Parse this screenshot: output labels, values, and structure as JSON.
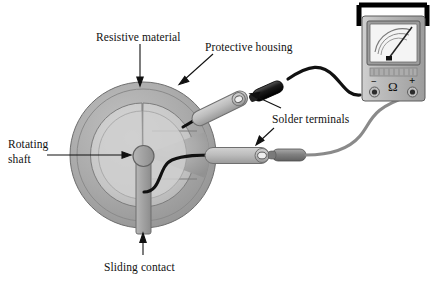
{
  "figure": {
    "type": "technical-illustration"
  },
  "labels": {
    "resistive_material": "Resistive material",
    "protective_housing": "Protective housing",
    "solder_terminals": "Solder terminals",
    "rotating_shaft_line1": "Rotating",
    "rotating_shaft_line2": "shaft",
    "sliding_contact": "Sliding contact"
  },
  "meter": {
    "name": "analog-ohmmeter",
    "unit_symbol": "Ω",
    "negative_terminal": "−",
    "positive_terminal": "+",
    "scale_arcs": 3,
    "needle_deflection_pct": 72
  },
  "colors": {
    "housing_outer": "#a9a9a9",
    "housing_inner": "#c9c9c9",
    "resistive_track": "#b2b2b2",
    "shaft": "#9e9e9e",
    "terminal_lug": "#b8b8b8",
    "black_wire": "#111111",
    "gray_wire": "#8a8a8a",
    "meter_body": "#b9b9b9",
    "meter_face": "#f2f2f2",
    "outline": "#4a4a4a",
    "label_text": "#111111"
  },
  "parts": [
    {
      "name": "protective-housing",
      "shape": "outer-disc"
    },
    {
      "name": "resistive-material",
      "shape": "c-shaped-track"
    },
    {
      "name": "rotating-shaft",
      "shape": "center-hub"
    },
    {
      "name": "sliding-contact",
      "shape": "radial-arm"
    },
    {
      "name": "solder-terminal-upper",
      "shape": "lug-with-eyelet"
    },
    {
      "name": "solder-terminal-lower",
      "shape": "lug-with-eyelet"
    },
    {
      "name": "lead-wire-black",
      "shape": "curved-cable"
    },
    {
      "name": "lead-wire-gray",
      "shape": "curved-cable"
    }
  ]
}
